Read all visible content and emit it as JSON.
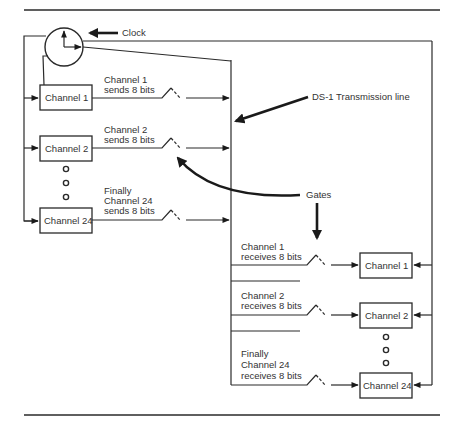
{
  "diagram": {
    "labels": {
      "clock": "Clock",
      "transmission_line": "DS-1 Transmission line",
      "gates": "Gates"
    },
    "senders": [
      {
        "box": "Channel 1",
        "caption": [
          "Channel 1",
          "sends 8 bits"
        ]
      },
      {
        "box": "Channel 2",
        "caption": [
          "Channel 2",
          "sends 8 bits"
        ]
      },
      {
        "box": "Channel 24",
        "caption": [
          "Finally",
          "Channel 24",
          "sends 8 bits"
        ]
      }
    ],
    "receivers": [
      {
        "box": "Channel 1",
        "caption": [
          "Channel 1",
          "receives 8 bits"
        ]
      },
      {
        "box": "Channel 2",
        "caption": [
          "Channel 2",
          "receives 8 bits"
        ]
      },
      {
        "box": "Channel 24",
        "caption": [
          "Finally",
          "Channel 24",
          "receives 8 bits"
        ]
      }
    ],
    "colors": {
      "line": "#2a2a2a",
      "text": "#333333",
      "background": "#ffffff"
    }
  }
}
